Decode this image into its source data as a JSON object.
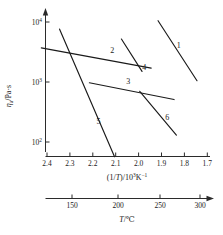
{
  "chart_data": {
    "type": "line",
    "title": "",
    "subtitle": "",
    "ylabel": "ηa/Pa·s",
    "ylabel_symbol": "η",
    "ylabel_sub": "a",
    "ylabel_unit": "/Pa·s",
    "xlabel_primary": "(1/T)/10³K⁻¹",
    "xlabel_primary_parts": {
      "lead": "(1/",
      "italic": "T",
      "mid": ")/10",
      "sup": "3",
      "tail": "K",
      "sup2": "−1"
    },
    "xlabel_secondary": "T/℃",
    "xlabel_secondary_parts": {
      "italic": "T",
      "tail": "/℃"
    },
    "yticks": [
      {
        "label": "10",
        "exp": "4",
        "value": 10000
      },
      {
        "label": "10",
        "exp": "3",
        "value": 1000
      },
      {
        "label": "10",
        "exp": "2",
        "value": 100
      }
    ],
    "ylim": [
      40,
      14000
    ],
    "yscale": "log",
    "xticks_primary": [
      "2.4",
      "2.3",
      "2.2",
      "2.1",
      "2.0",
      "1.9",
      "1.8",
      "1.7"
    ],
    "xticks_primary_values": [
      2.4,
      2.3,
      2.2,
      2.1,
      2.0,
      1.9,
      1.8,
      1.7
    ],
    "xlim_primary": [
      2.45,
      1.68
    ],
    "xticks_secondary": [
      "150",
      "200",
      "250",
      "300"
    ],
    "xticks_secondary_values": [
      150,
      200,
      250,
      300
    ],
    "grid": false,
    "legend": "none",
    "axis_direction_note": "reciprocal temperature decreases left to right",
    "series": [
      {
        "name": "1",
        "label": "1",
        "x": [
          1.915,
          1.745
        ],
        "y": [
          10500,
          1050
        ],
        "label_position": {
          "x": 1.825,
          "y": 4100
        }
      },
      {
        "name": "2",
        "label": "2",
        "x": [
          2.425,
          1.945
        ],
        "y": [
          3700,
          1700
        ],
        "label_position": {
          "x": 2.115,
          "y": 3450
        }
      },
      {
        "name": "3",
        "label": "3",
        "x": [
          2.215,
          1.845
        ],
        "y": [
          970,
          510
        ],
        "label_position": {
          "x": 2.045,
          "y": 1050
        }
      },
      {
        "name": "4",
        "label": "4",
        "x": [
          2.075,
          1.985
        ],
        "y": [
          5200,
          1500
        ],
        "label_position": {
          "x": 1.975,
          "y": 1750
        }
      },
      {
        "name": "5",
        "label": "5",
        "x": [
          2.345,
          2.105
        ],
        "y": [
          7600,
          57
        ],
        "label_position": {
          "x": 2.175,
          "y": 225
        }
      },
      {
        "name": "6",
        "label": "6",
        "x": [
          1.995,
          1.835
        ],
        "y": [
          700,
          130
        ],
        "label_position": {
          "x": 1.875,
          "y": 260
        }
      }
    ]
  }
}
